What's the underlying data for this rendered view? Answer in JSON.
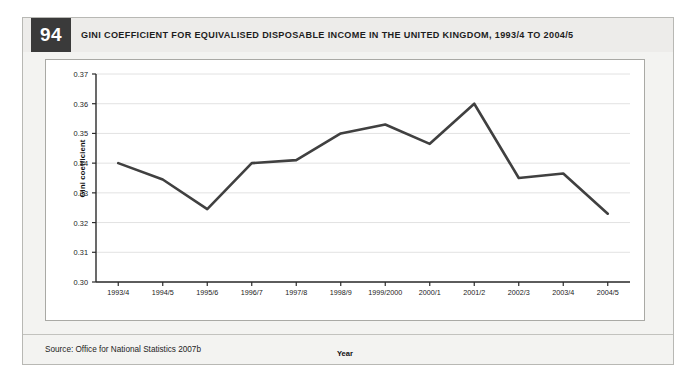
{
  "figure": {
    "number": "94",
    "title": "GINI COEFFICIENT FOR EQUIVALISED DISPOSABLE INCOME IN THE UNITED KINGDOM, 1993/4 TO 2004/5",
    "source": "Source: Office for National Statistics 2007b"
  },
  "colors": {
    "badge_background": "#3a3a3a",
    "badge_text": "#ffffff",
    "header_background": "#edecea",
    "panel_background": "#f3f3f1",
    "panel_border": "#b8b8b4",
    "plot_background": "#ffffff",
    "plot_border": "#a9a9a5",
    "line": "#404040",
    "gridline": "#e2e2e2",
    "axis": "#2b2b2b"
  },
  "chart_data": {
    "type": "line",
    "title": "GINI COEFFICIENT FOR EQUIVALISED DISPOSABLE INCOME IN THE UNITED KINGDOM, 1993/4 TO 2004/5",
    "xlabel": "Year",
    "ylabel": "Gini coefficient",
    "categories": [
      "1993/4",
      "1994/5",
      "1995/6",
      "1996/7",
      "1997/8",
      "1998/9",
      "1999/2000",
      "2000/1",
      "2001/2",
      "2002/3",
      "2003/4",
      "2004/5"
    ],
    "values": [
      0.34,
      0.3345,
      0.3245,
      0.34,
      0.341,
      0.35,
      0.353,
      0.3465,
      0.36,
      0.335,
      0.3365,
      0.323
    ],
    "ylim": [
      0.3,
      0.37
    ],
    "ytick_values": [
      0.3,
      0.31,
      0.32,
      0.33,
      0.34,
      0.35,
      0.36,
      0.37
    ],
    "ytick_labels": [
      "0.30",
      "0.31",
      "0.32",
      "0.33",
      "0.34",
      "0.35",
      "0.36",
      "0.37"
    ],
    "grid": true,
    "legend": false,
    "legend_position": "none",
    "series": [
      {
        "name": "Gini coefficient",
        "values": [
          0.34,
          0.3345,
          0.3245,
          0.34,
          0.341,
          0.35,
          0.353,
          0.3465,
          0.36,
          0.335,
          0.3365,
          0.323
        ]
      }
    ]
  }
}
